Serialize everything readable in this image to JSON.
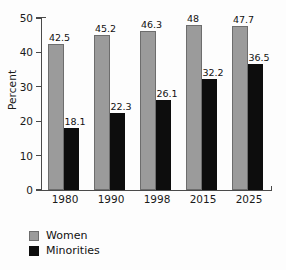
{
  "chart_data": {
    "type": "bar",
    "title": "",
    "xlabel": "",
    "ylabel": "Percent",
    "ylim": [
      0,
      50
    ],
    "yticks": [
      0,
      10,
      20,
      30,
      40,
      50
    ],
    "ytick_labels": [
      "0",
      "10",
      "20",
      "30",
      "40",
      "50"
    ],
    "grid": false,
    "legend_position": "bottom-left",
    "categories": [
      "1980",
      "1990",
      "1998",
      "2015",
      "2025"
    ],
    "series": [
      {
        "name": "Women",
        "color": "#9b9b9b",
        "values": [
          42.5,
          45.2,
          46.3,
          48,
          47.7
        ],
        "labels": [
          "42.5",
          "45.2",
          "46.3",
          "48",
          "47.7"
        ]
      },
      {
        "name": "Minorities",
        "color": "#0d0d0d",
        "values": [
          18.1,
          22.3,
          26.1,
          32.2,
          36.5
        ],
        "labels": [
          "18.1",
          "22.3",
          "26.1",
          "32.2",
          "36.5"
        ]
      }
    ]
  },
  "legend": {
    "items": [
      {
        "label": "Women",
        "swatch": "women-swatch"
      },
      {
        "label": "Minorities",
        "swatch": "minorities-swatch"
      }
    ]
  }
}
